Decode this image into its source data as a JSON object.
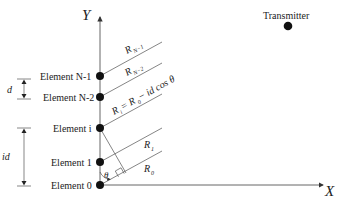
{
  "diagram": {
    "axes": {
      "y_label": "Y",
      "x_label": "X"
    },
    "transmitter": {
      "label": "Transmitter"
    },
    "elements": [
      {
        "label": "Element N-1",
        "y": 76
      },
      {
        "label": "Element N-2",
        "y": 97
      },
      {
        "label": "Element i",
        "y": 128
      },
      {
        "label": "Element 1",
        "y": 162
      },
      {
        "label": "Element 0",
        "y": 185
      }
    ],
    "distances": {
      "r_n1": "R",
      "r_n1_sub": "N−1",
      "r_n2": "R",
      "r_n2_sub": "N−2",
      "r_i_eq_prefix": "R",
      "r_i_sub": "i",
      "r_i_eq_mid": " = R",
      "r_i_eq_mid_sub": "0",
      "r_i_eq_suffix": " − id cos θ",
      "r1": "R",
      "r1_sub": "1",
      "r0": "R",
      "r0_sub": "0"
    },
    "dimensions": {
      "spacing_label": "d",
      "offset_label": "id"
    },
    "angle_label": "θ",
    "colors": {
      "line": "#555555",
      "dot": "#111111",
      "text": "#222222"
    }
  }
}
